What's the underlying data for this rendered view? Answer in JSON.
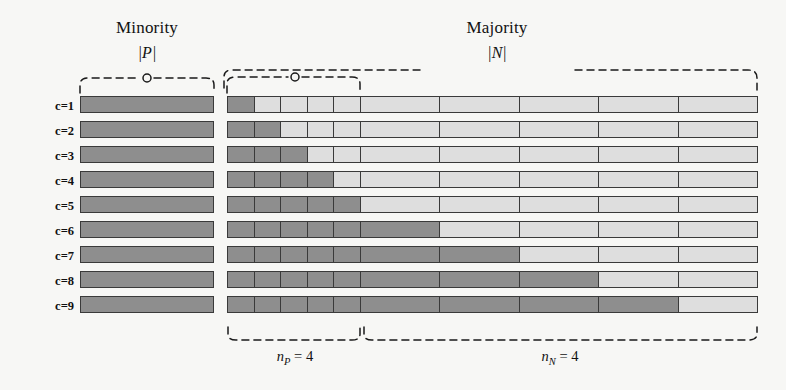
{
  "figure": {
    "background_color": "#f7f7f5",
    "dark_cell_color": "#8e8e8e",
    "light_cell_color": "#dedede",
    "stroke_color": "#3a3a3a"
  },
  "headings": {
    "minority": "Minority",
    "majority": "Majority",
    "minority_cardinality": "|P|",
    "majority_cardinality": "|N|"
  },
  "row_labels": [
    "c=1",
    "c=2",
    "c=3",
    "c=4",
    "c=5",
    "c=6",
    "c=7",
    "c=8",
    "c=9"
  ],
  "bottom_braces": {
    "minority_group": {
      "symbol": "n",
      "subscript": "P",
      "equals": "=",
      "value": "4",
      "full": "n_P = 4"
    },
    "majority_group": {
      "symbol": "n",
      "subscript": "N",
      "equals": "=",
      "value": "4",
      "full": "n_N = 4"
    }
  },
  "chart_data": {
    "type": "heatmap",
    "title": "",
    "row_categories": [
      "c=1",
      "c=2",
      "c=3",
      "c=4",
      "c=5",
      "c=6",
      "c=7",
      "c=8",
      "c=9"
    ],
    "minority_panel": {
      "label": "Minority",
      "cardinality": "|P|",
      "cells_per_row": 1,
      "fill": "dark",
      "values": [
        1,
        1,
        1,
        1,
        1,
        1,
        1,
        1,
        1
      ]
    },
    "majority_panel": {
      "label": "Majority",
      "cardinality": "|N|",
      "p_group_cells": 5,
      "n_group_cells": 5,
      "dark_counts": [
        1,
        2,
        3,
        4,
        5,
        6,
        7,
        8,
        9
      ],
      "rows": [
        {
          "label": "c=1",
          "p_dark": 1,
          "n_dark": 0
        },
        {
          "label": "c=2",
          "p_dark": 2,
          "n_dark": 0
        },
        {
          "label": "c=3",
          "p_dark": 3,
          "n_dark": 0
        },
        {
          "label": "c=4",
          "p_dark": 4,
          "n_dark": 0
        },
        {
          "label": "c=5",
          "p_dark": 5,
          "n_dark": 0
        },
        {
          "label": "c=6",
          "p_dark": 5,
          "n_dark": 1
        },
        {
          "label": "c=7",
          "p_dark": 5,
          "n_dark": 2
        },
        {
          "label": "c=8",
          "p_dark": 5,
          "n_dark": 3
        },
        {
          "label": "c=9",
          "p_dark": 5,
          "n_dark": 4
        }
      ]
    },
    "legend": [],
    "grid": true
  }
}
